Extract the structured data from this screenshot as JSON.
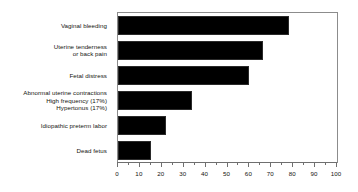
{
  "chart_data": {
    "type": "bar",
    "orientation": "horizontal",
    "title": "",
    "xlabel": "",
    "ylabel": "",
    "xlim": [
      0,
      100
    ],
    "grid": false,
    "legend": null,
    "categories": [
      "Vaginal bleeding",
      "Uterine tenderness or back pain",
      "Fetal distress",
      "Abnormal uterine contractions",
      "Idiopathic preterm labor",
      "Dead fetus"
    ],
    "values": [
      78,
      66,
      60,
      34,
      22,
      15
    ],
    "xticks": [
      0,
      10,
      20,
      30,
      40,
      50,
      60,
      70,
      80,
      90,
      100
    ],
    "xtick_labels": [
      "0",
      "10",
      "20",
      "30",
      "40",
      "50",
      "60",
      "70",
      "80",
      "90",
      "100"
    ],
    "minor_tick_interval": 5,
    "bar_color": "#000000",
    "frame_color": "#8c8c8c"
  },
  "labels": [
    {
      "line1": "Vaginal bleeding",
      "line2": "",
      "line3": ""
    },
    {
      "line1": "Uterine tenderness",
      "line2": "or back pain",
      "line3": ""
    },
    {
      "line1": "Fetal distress",
      "line2": "",
      "line3": ""
    },
    {
      "line1": "Abnormal uterine contractions",
      "line2": "High frequency (17%)",
      "line3": "Hypertonus (17%)"
    },
    {
      "line1": "Idiopathic preterm labor",
      "line2": "",
      "line3": ""
    },
    {
      "line1": "Dead fetus",
      "line2": "",
      "line3": ""
    }
  ]
}
